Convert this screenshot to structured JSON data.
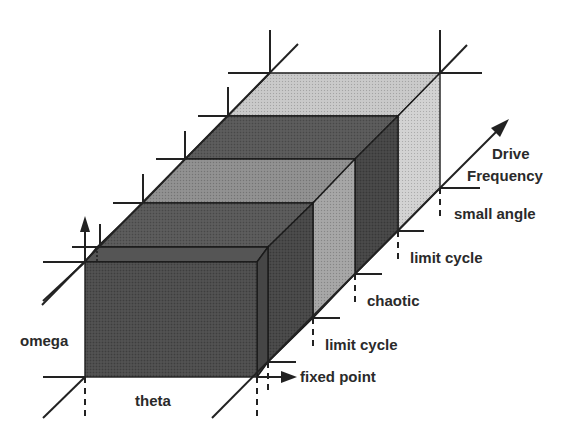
{
  "diagram": {
    "axes": {
      "vertical": "omega",
      "horizontal": "theta",
      "depth": "Drive Frequency",
      "depth_line1": "Drive",
      "depth_line2": "Frequency"
    },
    "regions": [
      {
        "label": "fixed point",
        "shade": "dark",
        "color": "#4e4e4e"
      },
      {
        "label": "limit cycle",
        "shade": "dark",
        "color": "#555555"
      },
      {
        "label": "chaotic",
        "shade": "medium",
        "color": "#8c8c8c"
      },
      {
        "label": "limit cycle",
        "shade": "dark",
        "color": "#555555"
      },
      {
        "label": "small angle",
        "shade": "light",
        "color": "#c6c6c6"
      }
    ],
    "colors": {
      "dark_top": "#585858",
      "dark_front": "#4a4a4a",
      "dark_side": "#404040",
      "medium_top": "#8e8e8e",
      "medium_side": "#a2a2a2",
      "light_top": "#c8c8c8",
      "light_side": "#d2d2d2",
      "line": "#222222"
    }
  }
}
